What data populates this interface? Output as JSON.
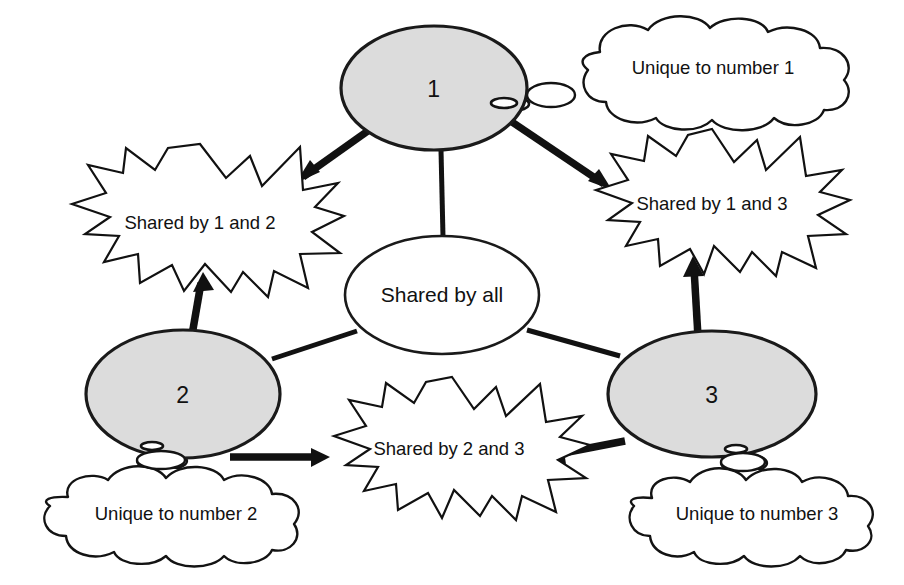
{
  "diagram": {
    "type": "venn-style-relationship-diagram",
    "title": "",
    "background_color": "#ffffff",
    "colors": {
      "node_fill": "#dcdcdc",
      "node_stroke": "#1a1a1a",
      "center_fill": "#ffffff",
      "burst_fill": "#ffffff",
      "cloud_fill": "#ffffff",
      "line": "#111111",
      "text": "#111111"
    },
    "nodes": [
      {
        "id": "node-1",
        "label": "1",
        "shape": "ellipse",
        "fill": "#dcdcdc",
        "cx": 434,
        "cy": 88,
        "rx": 93,
        "ry": 62
      },
      {
        "id": "node-2",
        "label": "2",
        "shape": "ellipse",
        "fill": "#dcdcdc",
        "cx": 183,
        "cy": 394,
        "rx": 97,
        "ry": 64
      },
      {
        "id": "node-3",
        "label": "3",
        "shape": "ellipse",
        "fill": "#dcdcdc",
        "cx": 712,
        "cy": 394,
        "rx": 104,
        "ry": 63
      }
    ],
    "center": {
      "id": "center-shared-all",
      "label": "Shared by all",
      "shape": "ellipse",
      "fill": "#ffffff",
      "cx": 442,
      "cy": 295,
      "rx": 97,
      "ry": 59
    },
    "bursts": [
      {
        "id": "burst-1-2",
        "label": "Shared by 1 and 2",
        "cx": 200,
        "cy": 222,
        "rx": 137,
        "ry": 78
      },
      {
        "id": "burst-1-3",
        "label": "Shared by 1 and 3",
        "cx": 710,
        "cy": 203,
        "rx": 134,
        "ry": 74
      },
      {
        "id": "burst-2-3",
        "label": "Shared by 2 and 3",
        "cx": 449,
        "cy": 450,
        "rx": 136,
        "ry": 73
      }
    ],
    "clouds": [
      {
        "id": "cloud-unique-1",
        "label": "Unique to number 1",
        "cx": 713,
        "cy": 68,
        "rx": 136,
        "ry": 48,
        "tail_from": "node-1",
        "tail_direction": "left-down"
      },
      {
        "id": "cloud-unique-2",
        "label": "Unique to number 2",
        "cx": 176,
        "cy": 513,
        "rx": 133,
        "ry": 42,
        "tail_from": "node-2",
        "tail_direction": "up-right"
      },
      {
        "id": "cloud-unique-3",
        "label": "Unique to number 3",
        "cx": 757,
        "cy": 513,
        "rx": 124,
        "ry": 42,
        "tail_from": "node-3",
        "tail_direction": "up-left"
      }
    ],
    "connectors": [
      {
        "id": "link-node1-center",
        "from": "node-1",
        "to": "center-shared-all",
        "style": "plain-line",
        "arrowhead": false
      },
      {
        "id": "link-node2-center",
        "from": "node-2",
        "to": "center-shared-all",
        "style": "plain-line",
        "arrowhead": false
      },
      {
        "id": "link-node3-center",
        "from": "node-3",
        "to": "center-shared-all",
        "style": "plain-line",
        "arrowhead": false
      },
      {
        "id": "arrow-node1-burst12",
        "from": "node-1",
        "to": "burst-1-2",
        "style": "thick-arrow",
        "arrowhead": true
      },
      {
        "id": "arrow-node1-burst13",
        "from": "node-1",
        "to": "burst-1-3",
        "style": "thick-arrow",
        "arrowhead": true
      },
      {
        "id": "arrow-node2-burst12",
        "from": "node-2",
        "to": "burst-1-2",
        "style": "thick-arrow",
        "arrowhead": true
      },
      {
        "id": "arrow-node2-burst23",
        "from": "node-2",
        "to": "burst-2-3",
        "style": "thick-arrow",
        "arrowhead": true
      },
      {
        "id": "arrow-node3-burst13",
        "from": "node-3",
        "to": "burst-1-3",
        "style": "thick-arrow",
        "arrowhead": true
      },
      {
        "id": "arrow-node3-burst23",
        "from": "node-3",
        "to": "burst-2-3",
        "style": "thick-arrow",
        "arrowhead": true
      }
    ]
  }
}
